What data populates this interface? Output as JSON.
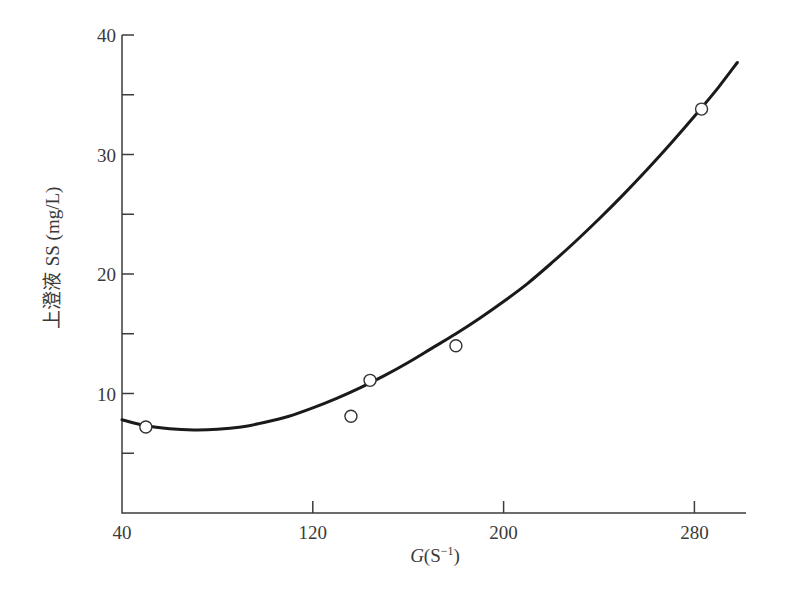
{
  "chart_data": {
    "type": "scatter",
    "title": "",
    "xlabel": "G(S⁻¹)",
    "xlabel_parts": {
      "var": "G",
      "paren_open": "(S",
      "sup": "−1",
      "paren_close": ")"
    },
    "ylabel": "上澄液 SS (mg/L)",
    "ylabel_parts": {
      "cjk": "上澄液 ",
      "unit": "SS (mg/L)"
    },
    "xlim": [
      40,
      300
    ],
    "ylim": [
      0,
      40
    ],
    "x_ticks": [
      40,
      120,
      200,
      280
    ],
    "x_tick_labels": [
      "40",
      "120",
      "200",
      "280"
    ],
    "y_ticks": [
      5,
      10,
      15,
      20,
      25,
      30,
      35,
      40
    ],
    "y_tick_labels": [
      "",
      "10",
      "",
      "20",
      "",
      "30",
      "",
      "40"
    ],
    "grid": false,
    "legend": null,
    "series": [
      {
        "name": "observed",
        "kind": "scatter",
        "marker": "open-circle",
        "points": [
          {
            "x": 50,
            "y": 7.2
          },
          {
            "x": 136,
            "y": 8.1
          },
          {
            "x": 144,
            "y": 11.1
          },
          {
            "x": 180,
            "y": 14.0
          },
          {
            "x": 283,
            "y": 33.8
          }
        ]
      },
      {
        "name": "fitted curve",
        "kind": "line",
        "color": "#1a1a1a",
        "points": [
          {
            "x": 40,
            "y": 7.8
          },
          {
            "x": 50,
            "y": 7.3
          },
          {
            "x": 60,
            "y": 7.05
          },
          {
            "x": 70,
            "y": 6.95
          },
          {
            "x": 80,
            "y": 7.0
          },
          {
            "x": 90,
            "y": 7.2
          },
          {
            "x": 100,
            "y": 7.6
          },
          {
            "x": 110,
            "y": 8.1
          },
          {
            "x": 120,
            "y": 8.8
          },
          {
            "x": 130,
            "y": 9.6
          },
          {
            "x": 140,
            "y": 10.5
          },
          {
            "x": 150,
            "y": 11.5
          },
          {
            "x": 160,
            "y": 12.6
          },
          {
            "x": 170,
            "y": 13.8
          },
          {
            "x": 180,
            "y": 15.0
          },
          {
            "x": 190,
            "y": 16.3
          },
          {
            "x": 200,
            "y": 17.7
          },
          {
            "x": 210,
            "y": 19.2
          },
          {
            "x": 220,
            "y": 20.9
          },
          {
            "x": 230,
            "y": 22.7
          },
          {
            "x": 240,
            "y": 24.6
          },
          {
            "x": 250,
            "y": 26.6
          },
          {
            "x": 260,
            "y": 28.7
          },
          {
            "x": 270,
            "y": 30.9
          },
          {
            "x": 280,
            "y": 33.2
          },
          {
            "x": 290,
            "y": 35.6
          },
          {
            "x": 298,
            "y": 37.7
          }
        ]
      }
    ],
    "colors": {
      "axis": "#3c3c3c",
      "curve": "#1a1a1a",
      "marker_fill": "#ffffff",
      "text": "#3a3a3a"
    }
  },
  "layout_px": {
    "x0": 122,
    "x_per_unit": 2.385,
    "y0": 513,
    "y_per_unit": 11.95,
    "x_axis_end": 746,
    "y_axis_top": 35
  }
}
